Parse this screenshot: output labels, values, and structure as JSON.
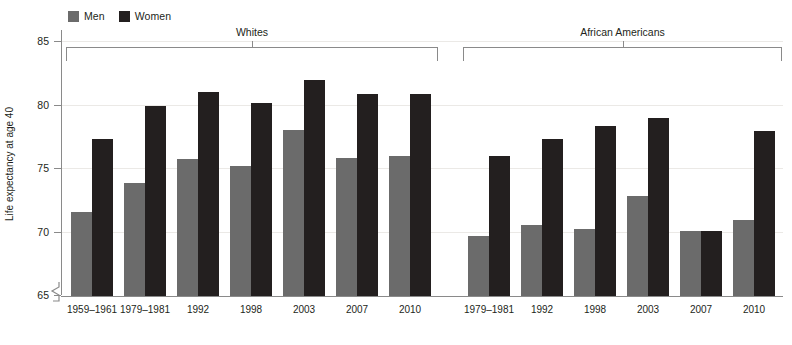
{
  "legend": {
    "items": [
      {
        "label": "Men",
        "color": "#6b6b6b",
        "icon": "square-swatch-icon"
      },
      {
        "label": "Women",
        "color": "#231f1f",
        "icon": "square-swatch-icon"
      }
    ]
  },
  "axis": {
    "y_title": "Life expectancy at age 40",
    "y_ticks": [
      "65",
      "70",
      "75",
      "80",
      "85"
    ],
    "y_break": true
  },
  "groups": [
    {
      "name": "Whites",
      "label": "Whites"
    },
    {
      "name": "African Americans",
      "label": "African Americans"
    }
  ],
  "chart_data": {
    "type": "bar",
    "title": "",
    "xlabel": "",
    "ylabel": "Life expectancy at age 40",
    "ylim": [
      65,
      85
    ],
    "yticks": [
      65,
      70,
      75,
      80,
      85
    ],
    "grid": true,
    "axis_break_below": 65,
    "legend_position": "top-left",
    "group_field": "race",
    "groups": [
      {
        "name": "Whites",
        "categories": [
          "1959–1961",
          "1979–1981",
          "1992",
          "1998",
          "2003",
          "2007",
          "2010"
        ],
        "series": [
          {
            "name": "Men",
            "color": "#6b6b6b",
            "values": [
              71.6,
              73.9,
              75.8,
              75.2,
              78.1,
              75.9,
              76.0
            ]
          },
          {
            "name": "Women",
            "color": "#231f1f",
            "values": [
              77.4,
              80.0,
              81.1,
              80.2,
              82.0,
              80.9,
              80.9
            ]
          }
        ]
      },
      {
        "name": "African Americans",
        "categories": [
          "1979–1981",
          "1992",
          "1998",
          "2003",
          "2007",
          "2010"
        ],
        "series": [
          {
            "name": "Men",
            "color": "#6b6b6b",
            "values": [
              69.7,
              70.6,
              70.3,
              72.9,
              70.1,
              71.0
            ]
          },
          {
            "name": "Women",
            "color": "#231f1f",
            "values": [
              76.0,
              77.4,
              78.4,
              79.0,
              70.1,
              78.0
            ]
          }
        ]
      }
    ]
  }
}
